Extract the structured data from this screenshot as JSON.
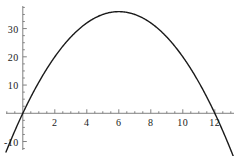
{
  "chart_data": {
    "type": "line",
    "title": "",
    "subtitle": "",
    "xlabel": "",
    "ylabel": "",
    "xlim": [
      -1.05,
      13.2
    ],
    "ylim": [
      -13,
      38
    ],
    "grid": false,
    "legend": null,
    "annotations": [],
    "axis_style": "cartesian-crossing-axes",
    "x_axis_position_y": 0,
    "y_axis_position_x": 0,
    "xticks": [
      2,
      4,
      6,
      8,
      10,
      12
    ],
    "xtick_labels": [
      "2",
      "4",
      "6",
      "8",
      "10",
      "12"
    ],
    "yticks": [
      -10,
      10,
      20,
      30
    ],
    "ytick_labels": [
      "-10",
      "10",
      "20",
      "30"
    ],
    "x_minor_tick_step": 0.5,
    "y_minor_tick_step": 2.5,
    "curve_color": "#1a1a1a",
    "axis_color": "#808080",
    "series": [
      {
        "name": "parabola",
        "expression": "y = -x^2 + 12x",
        "vertex": [
          6,
          36
        ],
        "roots": [
          0,
          12
        ],
        "x": [
          -1.05,
          -0.8,
          -0.5,
          -0.25,
          0,
          0.5,
          1,
          1.5,
          2,
          2.5,
          3,
          3.5,
          4,
          4.5,
          5,
          5.5,
          6,
          6.5,
          7,
          7.5,
          8,
          8.5,
          9,
          9.5,
          10,
          10.5,
          11,
          11.5,
          12,
          12.5,
          13,
          13.2
        ],
        "values": [
          -13.7,
          -10.24,
          -6.25,
          -3.06,
          0,
          5.75,
          11,
          15.75,
          20,
          23.75,
          27,
          29.75,
          32,
          33.75,
          35,
          35.75,
          36,
          35.75,
          35,
          33.75,
          32,
          29.75,
          27,
          23.75,
          20,
          15.75,
          11,
          5.75,
          0,
          -6.25,
          -13,
          -15.84
        ]
      }
    ]
  }
}
